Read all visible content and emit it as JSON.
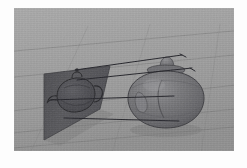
{
  "figure": {
    "title": "Orthographic projection of a 3D teapot onto an image plane",
    "type": "3d-rendering",
    "rendering_style": "grayscale ray-traced scene",
    "background_color": "#fdfdfd",
    "frame": {
      "x": 14,
      "y": 8,
      "width": 220,
      "height": 143,
      "border_color": "#ffffff"
    }
  },
  "scene": {
    "ground": {
      "name": "ground-plane",
      "color": "#9c9c9c",
      "highlight_color": "#b4b4b4",
      "shadow_color": "#848484",
      "grid_line_color": "#6e6e6e",
      "grid_visible": true,
      "grid_line_count": 6
    },
    "image_plane": {
      "name": "projection-plane",
      "color": "#545458",
      "edge_color": "#3a3a3e",
      "corners": [
        {
          "x": 30,
          "y": 66
        },
        {
          "x": 96,
          "y": 58
        },
        {
          "x": 86,
          "y": 100
        },
        {
          "x": 30,
          "y": 132
        }
      ],
      "label": "image plane"
    },
    "object": {
      "name": "teapot-solid",
      "label": "3D teapot",
      "body_color": "#6f6f72",
      "shade_color": "#57575a",
      "highlight_color": "#8a8a8d",
      "outline_color": "#3c3c3f",
      "center": {
        "x": 152,
        "y": 92
      },
      "radius_x": 38,
      "radius_y": 33,
      "knob": {
        "x": 152,
        "y": 50,
        "width": 14,
        "height": 12
      }
    },
    "silhouette": {
      "name": "projected-silhouette",
      "label": "projected teapot outline",
      "stroke_color": "#2b2b2e",
      "fill_color": "#4a4a4e"
    },
    "projection_rays": {
      "name": "projection-rays",
      "label": "parallel projection rays",
      "count": 4,
      "color": "#23232a",
      "width": 1.0,
      "lines": [
        {
          "x1": 72,
          "y1": 64,
          "x2": 168,
          "y2": 49
        },
        {
          "x1": 72,
          "y1": 75,
          "x2": 178,
          "y2": 64
        },
        {
          "x1": 40,
          "y1": 93,
          "x2": 158,
          "y2": 90
        },
        {
          "x1": 52,
          "y1": 113,
          "x2": 163,
          "y2": 114
        }
      ]
    },
    "camera": {
      "projection_type": "orthographic",
      "view": "perspective 3/4 view"
    }
  },
  "palette": {
    "page_background": "#fdfdfd",
    "ground": "#9c9c9c",
    "plane": "#545458",
    "object": "#6f6f72",
    "rays": "#23232a"
  }
}
